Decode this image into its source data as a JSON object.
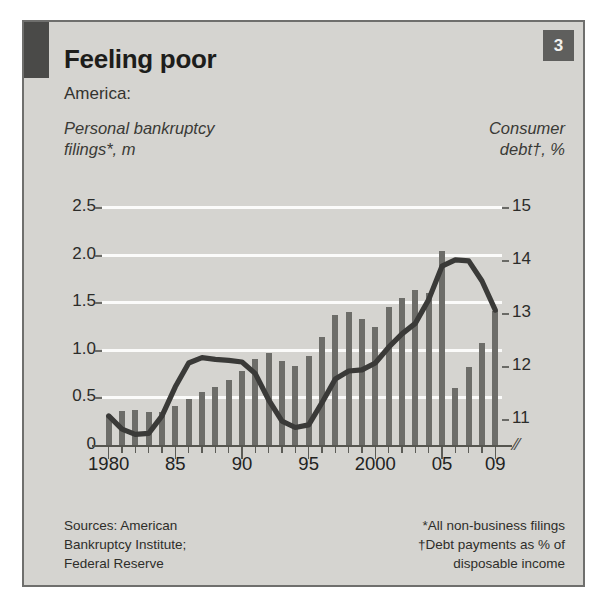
{
  "header": {
    "title": "Feeling poor",
    "subtitle": "America:",
    "badge": "3",
    "left_axis_title": "Personal bankruptcy\nfilings*, m",
    "left_axis_title_line1": "Personal bankruptcy",
    "left_axis_title_line2": "filings*, m",
    "right_axis_title_line1": "Consumer",
    "right_axis_title_line2": "debt†, %"
  },
  "footnotes": {
    "source_line1": "Sources: American",
    "source_line2": "Bankruptcy Institute;",
    "source_line3": "Federal Reserve",
    "note_line1": "*All non-business filings",
    "note_line2": "†Debt payments as % of",
    "note_line3": "disposable income"
  },
  "colors": {
    "panel_background": "#d5d4d0",
    "bar": "#6d6d69",
    "line": "#3a3a38",
    "gridline": "#fbfbfa",
    "badge": "#5f5f5d",
    "text": "#1d1d1b",
    "border": "#6f6f6d"
  },
  "chart_data": {
    "type": "bar",
    "title": "Feeling poor",
    "subtitle": "America:",
    "xlabel": "",
    "grid": true,
    "legend_position": "none",
    "x": [
      1980,
      1981,
      1982,
      1983,
      1984,
      1985,
      1986,
      1987,
      1988,
      1989,
      1990,
      1991,
      1992,
      1993,
      1994,
      1995,
      1996,
      1997,
      1998,
      1999,
      2000,
      2001,
      2002,
      2003,
      2004,
      2005,
      2006,
      2007,
      2008,
      2009
    ],
    "xtick_labels": [
      "1980",
      "85",
      "90",
      "95",
      "2000",
      "05",
      "09"
    ],
    "xtick_values": [
      1980,
      1985,
      1990,
      1995,
      2000,
      2005,
      2009
    ],
    "series": [
      {
        "name": "Personal bankruptcy filings*, m",
        "type": "bar",
        "axis": "left",
        "ylabel": "Personal bankruptcy filings*, m",
        "ylim": [
          0,
          2.5
        ],
        "ytick_labels": [
          "0",
          "0.5",
          "1.0",
          "1.5",
          "2.0",
          "2.5"
        ],
        "ytick_values": [
          0,
          0.5,
          1.0,
          1.5,
          2.0,
          2.5
        ],
        "values": [
          0.31,
          0.36,
          0.37,
          0.35,
          0.35,
          0.41,
          0.48,
          0.56,
          0.61,
          0.68,
          0.78,
          0.9,
          0.97,
          0.88,
          0.83,
          0.93,
          1.13,
          1.37,
          1.4,
          1.32,
          1.24,
          1.45,
          1.54,
          1.63,
          1.6,
          2.04,
          0.6,
          0.82,
          1.07,
          1.41
        ]
      },
      {
        "name": "Consumer debt†, %",
        "type": "line",
        "axis": "right",
        "ylabel": "Consumer debt†, %",
        "ylim": [
          10.5,
          15
        ],
        "ytick_labels": [
          "11",
          "12",
          "13",
          "14",
          "15"
        ],
        "ytick_values": [
          11,
          12,
          13,
          14,
          15
        ],
        "axis_break": true,
        "values": [
          11.05,
          10.8,
          10.7,
          10.72,
          11.05,
          11.6,
          12.05,
          12.15,
          12.12,
          12.1,
          12.07,
          11.85,
          11.35,
          10.95,
          10.83,
          10.88,
          11.3,
          11.75,
          11.9,
          11.92,
          12.05,
          12.35,
          12.6,
          12.8,
          13.25,
          13.88,
          14.0,
          13.98,
          13.6,
          13.05
        ]
      }
    ]
  }
}
